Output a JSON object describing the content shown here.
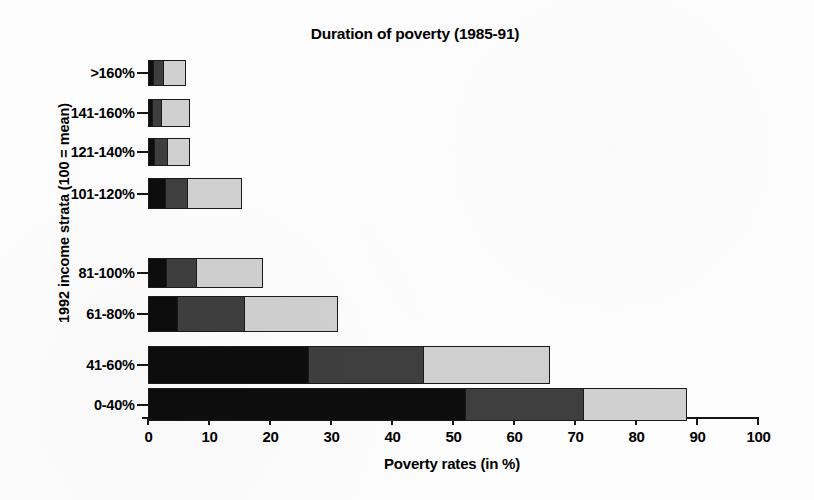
{
  "chart_data": {
    "type": "bar",
    "orientation": "horizontal",
    "stacked": true,
    "title": "Duration of poverty (1985-91)",
    "xlabel": "Poverty rates (in %)",
    "ylabel": "1992 income strata (100 = mean)",
    "xlim": [
      0,
      100
    ],
    "xticks": [
      0,
      10,
      20,
      30,
      40,
      50,
      60,
      70,
      80,
      90,
      100
    ],
    "xtick_labels": [
      "0",
      "10",
      "20",
      "30",
      "40",
      "50",
      "60",
      "70",
      "80",
      "90",
      "100"
    ],
    "grid": false,
    "legend": null,
    "categories": [
      ">160%",
      "141-160%",
      "121-140%",
      "101-120%",
      "",
      "81-100%",
      "61-80%",
      "",
      "41-60%",
      "0-40%"
    ],
    "series": [
      {
        "name": "long-duration",
        "color": "#0d0d0d",
        "values": [
          0.8,
          0.6,
          1.0,
          2.8,
          null,
          3.0,
          4.7,
          null,
          26.3,
          52.0
        ]
      },
      {
        "name": "medium-duration",
        "color": "#3f3f3f",
        "values": [
          1.7,
          1.6,
          2.2,
          3.7,
          null,
          5.0,
          11.1,
          null,
          19.0,
          19.5
        ]
      },
      {
        "name": "short-duration",
        "color": "#d0d0d0",
        "values": [
          3.8,
          4.8,
          3.8,
          9.0,
          null,
          11.0,
          15.5,
          null,
          20.7,
          17.0
        ]
      }
    ],
    "totals": [
      6.3,
      7.0,
      7.0,
      15.5,
      null,
      19.0,
      31.3,
      null,
      66.0,
      88.5
    ],
    "cumulative": [
      {
        "category": ">160%",
        "long": 0.8,
        "long_plus_medium": 2.5,
        "total": 6.3
      },
      {
        "category": "141-160%",
        "long": 0.6,
        "long_plus_medium": 2.2,
        "total": 7.0
      },
      {
        "category": "121-140%",
        "long": 1.0,
        "long_plus_medium": 3.2,
        "total": 7.0
      },
      {
        "category": "101-120%",
        "long": 2.8,
        "long_plus_medium": 6.5,
        "total": 15.5
      },
      {
        "category": "81-100%",
        "long": 3.0,
        "long_plus_medium": 8.0,
        "total": 19.0
      },
      {
        "category": "61-80%",
        "long": 4.7,
        "long_plus_medium": 15.8,
        "total": 31.3
      },
      {
        "category": "41-60%",
        "long": 26.3,
        "long_plus_medium": 45.3,
        "total": 66.0
      },
      {
        "category": "0-40%",
        "long": 52.0,
        "long_plus_medium": 71.5,
        "total": 88.5
      }
    ]
  },
  "bars": [
    {
      "label": ">160%",
      "y": 24,
      "height": 26,
      "segments": [
        0.8,
        1.7,
        3.8
      ]
    },
    {
      "label": "141-160%",
      "y": 63,
      "height": 28,
      "segments": [
        0.6,
        1.6,
        4.8
      ]
    },
    {
      "label": "121-140%",
      "y": 102,
      "height": 28,
      "segments": [
        1.0,
        2.2,
        3.8
      ]
    },
    {
      "label": "101-120%",
      "y": 142,
      "height": 31,
      "segments": [
        2.8,
        3.7,
        9.0
      ]
    },
    {
      "label": "81-100%",
      "y": 222,
      "height": 30,
      "segments": [
        3.0,
        5.0,
        11.0
      ]
    },
    {
      "label": "61-80%",
      "y": 260,
      "height": 36,
      "segments": [
        4.7,
        11.1,
        15.5
      ]
    },
    {
      "label": "41-60%",
      "y": 310,
      "height": 38,
      "segments": [
        26.3,
        19.0,
        20.7
      ]
    },
    {
      "label": "0-40%",
      "y": 352,
      "height": 33,
      "segments": [
        52.0,
        19.5,
        17.0
      ]
    }
  ],
  "colors": {
    "long_duration": "#0d0d0d",
    "medium_duration": "#3f3f3f",
    "short_duration": "#d0d0d0",
    "axis": "#161616",
    "background": "#fdfdfd"
  }
}
